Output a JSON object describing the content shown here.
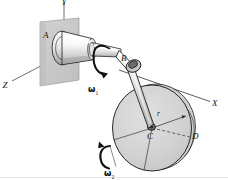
{
  "figure": {
    "background_color": "#ffffff",
    "labels": {
      "point_a": "A",
      "point_b": "B",
      "point_c": "C",
      "point_d": "D",
      "radius": "r",
      "axis_x": "X",
      "axis_z": "Z",
      "axis_y": "Y",
      "omega_1": "ω",
      "omega_1_sub": "1",
      "omega_2": "ω",
      "omega_2_sub": "2"
    },
    "colors": {
      "outline": "#151515",
      "wall_fill": "#c9c9c9",
      "disc_fill": "#d4d4d4",
      "shaft_light": "#fdfdfd",
      "shaft_shadow": "#b8b8b8",
      "arm_fill": "#e8e8e8",
      "hub_dark": "#6f6f6f",
      "axis_line": "#3a3a3a",
      "page_artifact": "#e2e2e2"
    },
    "geometry": {
      "wall_plate": "parallelogram at upper-left, x 38-79, y 18-86",
      "disc_center": [
        152,
        128
      ],
      "disc_radius_x": 40,
      "disc_radius_y": 43,
      "axis_x_from": [
        118,
        70
      ],
      "axis_x_to": [
        210,
        102
      ],
      "axis_z_from": [
        58,
        57
      ],
      "axis_z_to": [
        11,
        82
      ],
      "axis_y_from": [
        64,
        36
      ],
      "axis_y_to": [
        64,
        2
      ]
    }
  }
}
